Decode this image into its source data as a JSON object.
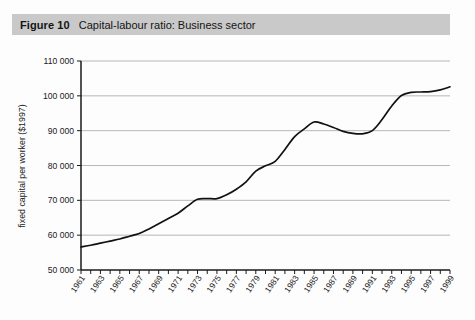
{
  "figure": {
    "number_label": "Figure 10",
    "title": "Capital-labour ratio: Business sector"
  },
  "chart_data": {
    "type": "line",
    "title": "Capital-labour ratio: Business sector",
    "xlabel": "",
    "ylabel": "fixed capital per worker ($1997)",
    "xlim": [
      1961,
      1999
    ],
    "ylim": [
      50000,
      110000
    ],
    "ytick_step": 10000,
    "ytick_labels": [
      "110 000",
      "100 000",
      "90 000",
      "80 000",
      "70 000",
      "60 000",
      "50 000"
    ],
    "ytick_values": [
      110000,
      100000,
      90000,
      80000,
      70000,
      60000,
      50000
    ],
    "xtick_labels": [
      "1961",
      "1963",
      "1965",
      "1967",
      "1969",
      "1971",
      "1973",
      "1975",
      "1977",
      "1979",
      "1981",
      "1983",
      "1985",
      "1987",
      "1989",
      "1991",
      "1993",
      "1995",
      "1997",
      "1999"
    ],
    "xtick_values": [
      1961,
      1963,
      1965,
      1967,
      1969,
      1971,
      1973,
      1975,
      1977,
      1979,
      1981,
      1983,
      1985,
      1987,
      1989,
      1991,
      1993,
      1995,
      1997,
      1999
    ],
    "grid": true,
    "grid_axis": "y",
    "legend": false,
    "line_color": "#111111",
    "series": [
      {
        "name": "Fixed capital per worker",
        "x": [
          1961,
          1962,
          1963,
          1964,
          1965,
          1966,
          1967,
          1968,
          1969,
          1970,
          1971,
          1972,
          1973,
          1974,
          1975,
          1976,
          1977,
          1978,
          1979,
          1980,
          1981,
          1982,
          1983,
          1984,
          1985,
          1986,
          1987,
          1988,
          1989,
          1990,
          1991,
          1992,
          1993,
          1994,
          1995,
          1996,
          1997,
          1998,
          1999
        ],
        "values": [
          56600,
          57100,
          57700,
          58300,
          58900,
          59700,
          60500,
          61800,
          63300,
          64800,
          66300,
          68400,
          70300,
          70500,
          70500,
          71600,
          73200,
          75300,
          78400,
          79900,
          81200,
          84600,
          88300,
          90500,
          92500,
          91900,
          90900,
          89800,
          89200,
          89100,
          90000,
          93200,
          97100,
          100100,
          101000,
          101100,
          101200,
          101700,
          102600
        ]
      }
    ]
  }
}
